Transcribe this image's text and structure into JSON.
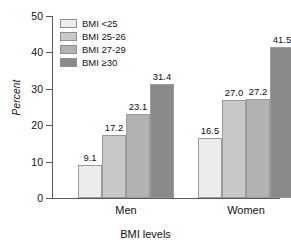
{
  "chart_data": {
    "type": "bar",
    "title": "",
    "xlabel": "BMI levels",
    "ylabel": "Percent",
    "categories": [
      "Men",
      "Women"
    ],
    "series": [
      {
        "name": "BMI <25",
        "values": [
          9.1,
          16.5
        ],
        "color": "#ececec"
      },
      {
        "name": "BMI 25-26",
        "values": [
          17.2,
          27.0
        ],
        "color": "#c8c8c8"
      },
      {
        "name": "BMI 27-29",
        "values": [
          23.1,
          27.2
        ],
        "color": "#b2b2b2"
      },
      {
        "name": "BMI ≥30",
        "values": [
          31.4,
          41.5
        ],
        "color": "#8a8a8a"
      }
    ],
    "value_labels": [
      [
        "9.1",
        "17.2",
        "23.1",
        "31.4"
      ],
      [
        "16.5",
        "27.0",
        "27.2",
        "41.5"
      ]
    ],
    "ylim": [
      0,
      50
    ],
    "yticks": [
      0,
      10,
      20,
      30,
      40,
      50
    ],
    "ytick_labels": [
      "0",
      "10",
      "20",
      "30",
      "40",
      "50"
    ],
    "grid": false,
    "legend_position": "top-left"
  },
  "axis": {
    "ylabel": "Percent",
    "xlabel": "BMI levels"
  },
  "legend": {
    "items": [
      {
        "label": "BMI <25"
      },
      {
        "label": "BMI 25-26"
      },
      {
        "label": "BMI 27-29"
      },
      {
        "label": "BMI ≥30"
      }
    ]
  },
  "groups": [
    {
      "label": "Men"
    },
    {
      "label": "Women"
    }
  ]
}
